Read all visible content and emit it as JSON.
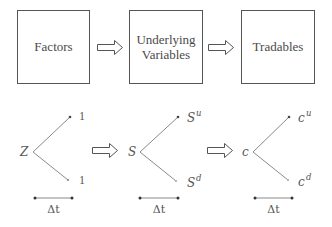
{
  "diagram": {
    "top_row": {
      "boxes": [
        {
          "label_lines": [
            "Factors"
          ]
        },
        {
          "label_lines": [
            "Underlying",
            "Variables"
          ]
        },
        {
          "label_lines": [
            "Tradables"
          ]
        }
      ],
      "arrows": [
        "hollow-right-arrow",
        "hollow-right-arrow"
      ]
    },
    "bottom_row": {
      "trees": [
        {
          "root": "Z",
          "up": {
            "base": "1",
            "sup": ""
          },
          "down": {
            "base": "1",
            "sup": ""
          },
          "interval": "Δt"
        },
        {
          "root": "S",
          "up": {
            "base": "S",
            "sup": "u"
          },
          "down": {
            "base": "S",
            "sup": "d"
          },
          "interval": "Δt"
        },
        {
          "root": "c",
          "up": {
            "base": "c",
            "sup": "u"
          },
          "down": {
            "base": "c",
            "sup": "d"
          },
          "interval": "Δt"
        }
      ],
      "arrows": [
        "hollow-right-arrow",
        "hollow-right-arrow"
      ]
    },
    "colors": {
      "box_stroke": "#555555",
      "line": "#8a8a8a",
      "text": "#4a4a4a"
    }
  }
}
